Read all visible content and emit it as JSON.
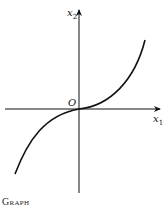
{
  "diagram": {
    "type": "function-graph",
    "axes": {
      "horizontal_label": "x",
      "horizontal_subscript": "1",
      "vertical_label": "x",
      "vertical_subscript": "2",
      "origin_label": "O"
    },
    "caption": "Graph",
    "colors": {
      "stroke": "#111111",
      "background": "#ffffff"
    }
  }
}
